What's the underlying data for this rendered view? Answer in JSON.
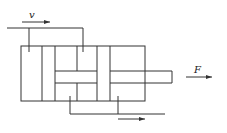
{
  "diagram": {
    "type": "hydraulic-cylinder-schematic",
    "labels": {
      "velocity": "v",
      "force": "F"
    },
    "colors": {
      "stroke": "#333333",
      "background": "#ffffff"
    },
    "elements": {
      "top_pipe": "inlet line with flow arrow labeled v",
      "cylinder_body": "rectangular housing with internal chambers",
      "piston_rod": "rod extending to the right",
      "bottom_pipe": "outlet line with flow arrow",
      "force_arrow": "arrow labeled F pointing right"
    }
  }
}
